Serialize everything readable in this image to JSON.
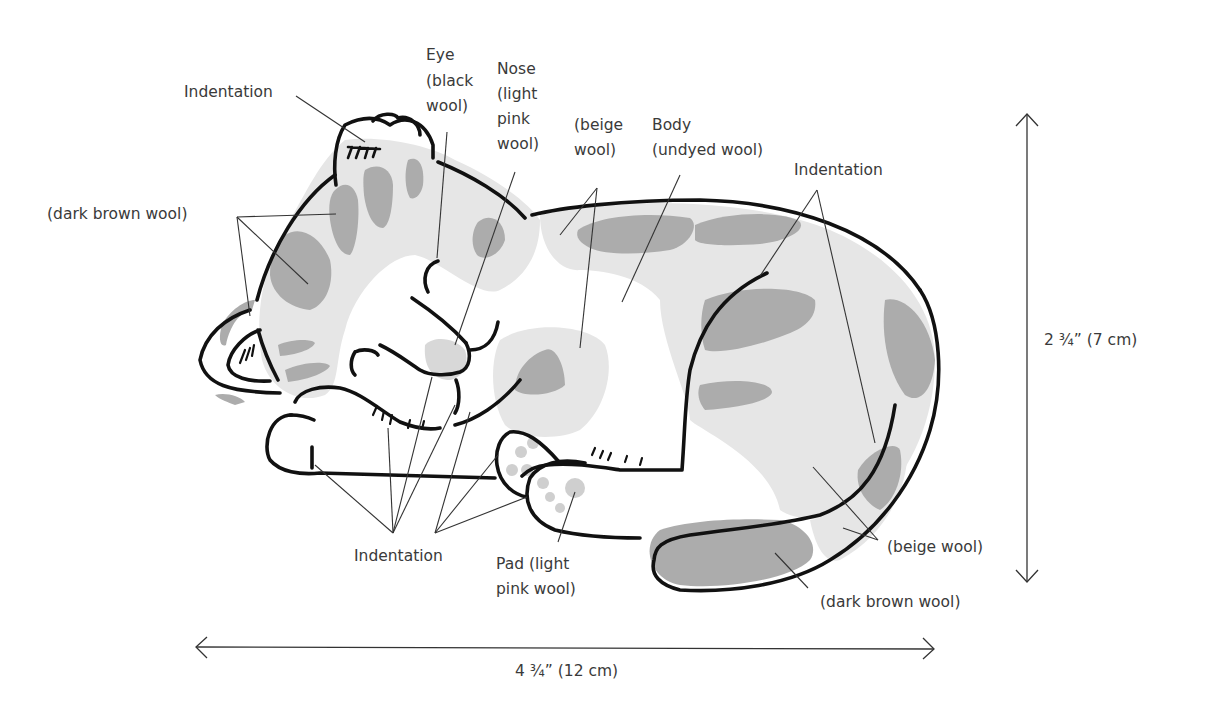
{
  "colors": {
    "outline": "#111111",
    "beige_fill": "#e6e6e6",
    "dark_brown_fill": "#acacac",
    "undyed_fill": "#ffffff",
    "text": "#3a3a3a"
  },
  "labels": {
    "indentation_top": "Indentation",
    "eye": [
      "Eye",
      "(black",
      "wool)"
    ],
    "nose": [
      "Nose",
      "(light",
      "pink",
      "wool)"
    ],
    "beige_top": [
      "(beige",
      "wool)"
    ],
    "body": [
      "Body",
      "(undyed wool)"
    ],
    "indentation_right": "Indentation",
    "dark_brown_left": "(dark brown wool)",
    "indentation_bottom": "Indentation",
    "pad": [
      "Pad (light",
      "pink wool)"
    ],
    "beige_right": "(beige wool)",
    "dark_brown_bottom": "(dark brown wool)"
  },
  "dimensions": {
    "height": "2 ¾” (7 cm)",
    "width": "4 ¾” (12 cm)"
  }
}
